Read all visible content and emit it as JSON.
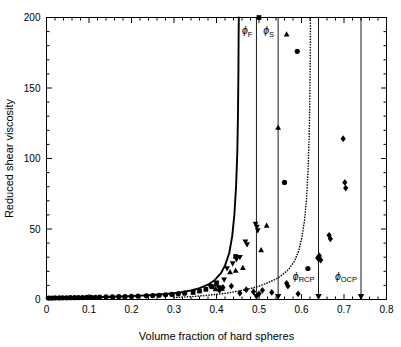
{
  "chart_data": {
    "type": "scatter",
    "title": "",
    "xlabel": "Volume fraction of hard spheres",
    "ylabel": "Reduced shear viscosity",
    "xlim": [
      0,
      0.8
    ],
    "ylim": [
      0,
      200
    ],
    "xticks": [
      0,
      0.1,
      0.2,
      0.3,
      0.4,
      0.5,
      0.6,
      0.7,
      0.8
    ],
    "xticklabels": [
      "0",
      "0.1",
      "0.2",
      "0.3",
      "0.4",
      "0.5",
      "0.6",
      "0.7",
      "0.8"
    ],
    "yticks": [
      0,
      50,
      100,
      150,
      200
    ],
    "yticklabels": [
      "0",
      "50",
      "100",
      "150",
      "200"
    ],
    "x_minor_interval": 0.02,
    "y_minor_interval": 10,
    "grid": false,
    "legend": null,
    "annotations": [
      {
        "name": "phi-F",
        "label": "ϕ",
        "sub": "F",
        "x": 0.494,
        "label_y": 188,
        "vline": true,
        "axis_arrow": true
      },
      {
        "name": "phi-S",
        "label": "ϕ",
        "sub": "S",
        "x": 0.545,
        "label_y": 188,
        "vline": true,
        "axis_arrow": true
      },
      {
        "name": "phi-RCP",
        "label": "ϕ",
        "sub": "RCP",
        "x": 0.64,
        "label_y": 14,
        "vline": true,
        "axis_arrow": true
      },
      {
        "name": "phi-OCP",
        "label": "ϕ",
        "sub": "OCP",
        "x": 0.74,
        "label_y": 14,
        "vline": true,
        "axis_arrow": true
      }
    ],
    "curves": [
      {
        "name": "solid-curve",
        "style": "solid",
        "points": [
          [
            0.0,
            1.0
          ],
          [
            0.05,
            1.2
          ],
          [
            0.1,
            1.5
          ],
          [
            0.15,
            1.9
          ],
          [
            0.2,
            2.4
          ],
          [
            0.25,
            3.2
          ],
          [
            0.28,
            3.9
          ],
          [
            0.3,
            4.5
          ],
          [
            0.32,
            5.3
          ],
          [
            0.34,
            6.4
          ],
          [
            0.36,
            8.0
          ],
          [
            0.38,
            10.5
          ],
          [
            0.395,
            13.5
          ],
          [
            0.41,
            18.5
          ],
          [
            0.42,
            24.0
          ],
          [
            0.43,
            33.0
          ],
          [
            0.437,
            45.0
          ],
          [
            0.442,
            60.0
          ],
          [
            0.446,
            80.0
          ],
          [
            0.449,
            105.0
          ],
          [
            0.4505,
            130.0
          ],
          [
            0.4515,
            160.0
          ],
          [
            0.452,
            185.0
          ],
          [
            0.4525,
            200.0
          ]
        ]
      },
      {
        "name": "dotted-curve",
        "style": "dotted",
        "points": [
          [
            0.3,
            1.4
          ],
          [
            0.34,
            2.0
          ],
          [
            0.37,
            2.7
          ],
          [
            0.4,
            3.6
          ],
          [
            0.43,
            4.8
          ],
          [
            0.455,
            6.2
          ],
          [
            0.48,
            7.8
          ],
          [
            0.5,
            9.5
          ],
          [
            0.52,
            11.8
          ],
          [
            0.54,
            14.5
          ],
          [
            0.555,
            17.5
          ],
          [
            0.57,
            21.5
          ],
          [
            0.583,
            27.0
          ],
          [
            0.593,
            34.0
          ],
          [
            0.601,
            44.0
          ],
          [
            0.607,
            56.0
          ],
          [
            0.612,
            72.0
          ],
          [
            0.6155,
            92.0
          ],
          [
            0.618,
            115.0
          ],
          [
            0.6195,
            140.0
          ],
          [
            0.6205,
            168.0
          ],
          [
            0.621,
            200.0
          ]
        ]
      }
    ],
    "series": [
      {
        "name": "circles",
        "marker": "circle",
        "points": [
          [
            0.005,
            1.0
          ],
          [
            0.012,
            1.0
          ],
          [
            0.02,
            1.1
          ],
          [
            0.03,
            1.1
          ],
          [
            0.038,
            1.2
          ],
          [
            0.047,
            1.2
          ],
          [
            0.056,
            1.3
          ],
          [
            0.066,
            1.3
          ],
          [
            0.075,
            1.4
          ],
          [
            0.085,
            1.4
          ],
          [
            0.095,
            1.5
          ],
          [
            0.105,
            1.6
          ],
          [
            0.115,
            1.6
          ],
          [
            0.125,
            1.7
          ],
          [
            0.14,
            1.8
          ],
          [
            0.155,
            1.9
          ],
          [
            0.17,
            2.0
          ],
          [
            0.185,
            2.1
          ],
          [
            0.2,
            2.2
          ],
          [
            0.215,
            2.4
          ],
          [
            0.235,
            2.6
          ],
          [
            0.25,
            2.8
          ],
          [
            0.265,
            3.0
          ],
          [
            0.28,
            3.3
          ],
          [
            0.295,
            3.6
          ],
          [
            0.31,
            4.0
          ],
          [
            0.325,
            4.5
          ],
          [
            0.56,
            83.0
          ],
          [
            0.59,
            176.0
          ],
          [
            0.615,
            22.0
          ]
        ]
      },
      {
        "name": "squares",
        "marker": "square",
        "points": [
          [
            0.345,
            5.0
          ],
          [
            0.36,
            6.0
          ],
          [
            0.375,
            7.2
          ],
          [
            0.39,
            9.0
          ],
          [
            0.4,
            11.0
          ],
          [
            0.445,
            30.5
          ],
          [
            0.5,
            200.0
          ]
        ]
      },
      {
        "name": "down-triangles",
        "marker": "triangle-down",
        "points": [
          [
            0.385,
            9.5
          ],
          [
            0.4,
            12.0
          ],
          [
            0.405,
            8.5
          ],
          [
            0.418,
            14.0
          ],
          [
            0.425,
            22.0
          ],
          [
            0.438,
            25.5
          ],
          [
            0.447,
            28.5
          ],
          [
            0.455,
            30.0
          ],
          [
            0.468,
            41.0
          ],
          [
            0.472,
            39.0
          ],
          [
            0.492,
            53.5
          ],
          [
            0.495,
            51.5
          ],
          [
            0.497,
            49.0
          ]
        ]
      },
      {
        "name": "up-triangles",
        "marker": "triangle-up",
        "points": [
          [
            0.398,
            7.5
          ],
          [
            0.408,
            8.0
          ],
          [
            0.413,
            7.8
          ],
          [
            0.432,
            19.5
          ],
          [
            0.445,
            20.5
          ],
          [
            0.462,
            22.5
          ],
          [
            0.505,
            35.0
          ],
          [
            0.518,
            52.5
          ],
          [
            0.545,
            122.0
          ],
          [
            0.565,
            188.0
          ]
        ]
      },
      {
        "name": "diamonds",
        "marker": "diamond",
        "points": [
          [
            0.407,
            6.5
          ],
          [
            0.415,
            8.5
          ],
          [
            0.435,
            9.5
          ],
          [
            0.455,
            4.5
          ],
          [
            0.47,
            7.0
          ],
          [
            0.487,
            5.5
          ],
          [
            0.5,
            4.0
          ],
          [
            0.508,
            6.5
          ],
          [
            0.53,
            5.0
          ],
          [
            0.565,
            11.5
          ],
          [
            0.568,
            9.5
          ],
          [
            0.592,
            4.0
          ],
          [
            0.638,
            29.5
          ],
          [
            0.642,
            31.0
          ],
          [
            0.645,
            28.0
          ],
          [
            0.665,
            45.5
          ],
          [
            0.668,
            43.0
          ],
          [
            0.698,
            114.0
          ],
          [
            0.702,
            83.0
          ],
          [
            0.704,
            79.0
          ]
        ]
      }
    ]
  },
  "caption": {
    "partial_text": ""
  }
}
